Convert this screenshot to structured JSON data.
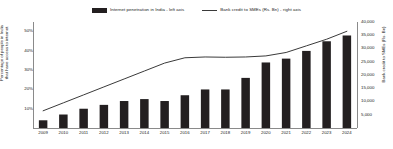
{
  "chart_data": {
    "type": "bar",
    "title": "",
    "categories": [
      "2009",
      "2010",
      "2011",
      "2012",
      "2013",
      "2014",
      "2015",
      "2016",
      "2017",
      "2018",
      "2019",
      "2020",
      "2021",
      "2022",
      "2023",
      "2024"
    ],
    "series": [
      {
        "name": "Internet penetration in India - left axis",
        "type": "bar",
        "axis": "left",
        "color": "#231f20",
        "unit": "%",
        "values": [
          4,
          7,
          10,
          12,
          14,
          15,
          14,
          17,
          20,
          20,
          26,
          34,
          36,
          40,
          45,
          48
        ]
      },
      {
        "name": "Bank credit to SMEs (Rs. Bn) - right axis",
        "type": "line",
        "axis": "right",
        "color": "#3a3a3a",
        "unit": "Rs. Bn",
        "values": [
          6500,
          9500,
          12500,
          15500,
          18500,
          21500,
          24500,
          26500,
          26800,
          26700,
          26800,
          27200,
          28500,
          31000,
          33500,
          36500
        ]
      }
    ],
    "ylabel_left": "Percentage of people in India that have access to internet",
    "ylabel_right": "Bank credit to SMEs (Rs. Bn)",
    "xlabel": "",
    "ylim_left": [
      0,
      55
    ],
    "ylim_right": [
      0,
      40000
    ],
    "yticks_left": [
      "50%",
      "40%",
      "30%",
      "20%",
      "10%"
    ],
    "yticks_left_values": [
      50,
      40,
      30,
      20,
      10
    ],
    "yticks_right": [
      "40,000",
      "35,000",
      "30,000",
      "25,000",
      "20,000",
      "15,000",
      "10,000",
      "5,000"
    ],
    "yticks_right_values": [
      40000,
      35000,
      30000,
      25000,
      20000,
      15000,
      10000,
      5000
    ],
    "grid": false,
    "legend_position": "top-center"
  },
  "legend": {
    "bar_label": "Internet penetration in India - left axis",
    "line_label": "Bank credit to SMEs (Rs. Bn) - right axis"
  }
}
